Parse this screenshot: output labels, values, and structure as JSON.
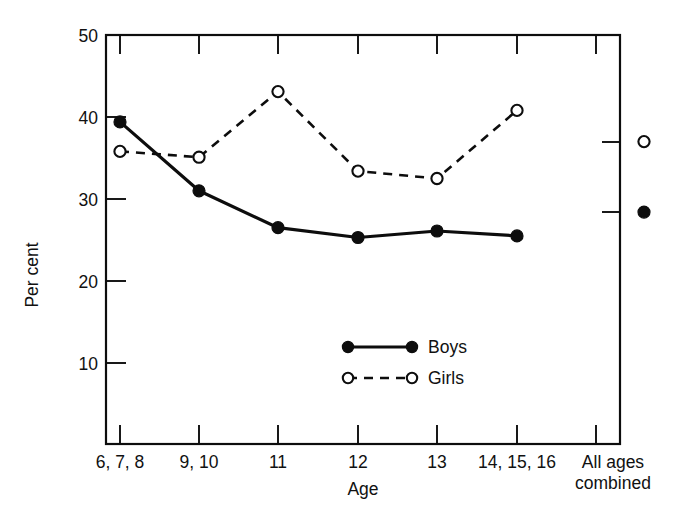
{
  "chart_data": {
    "type": "line",
    "title": "",
    "xlabel": "Age",
    "ylabel": "Per cent",
    "categories": [
      "6, 7, 8",
      "9, 10",
      "11",
      "12",
      "13",
      "14, 15, 16",
      "All ages combined"
    ],
    "ylim": [
      0,
      50
    ],
    "yticks": [
      10,
      20,
      30,
      40,
      50
    ],
    "ytick_labels": [
      "10",
      "20",
      "30",
      "40",
      "50"
    ],
    "grid": false,
    "legend_position": "inside-bottom-center",
    "series": [
      {
        "name": "Boys",
        "marker": "filled-circle",
        "line_style": "solid",
        "values": [
          39.4,
          31.0,
          26.5,
          25.3,
          26.1,
          25.5,
          28.4
        ]
      },
      {
        "name": "Girls",
        "marker": "open-circle",
        "line_style": "dashed",
        "values": [
          35.8,
          35.1,
          43.1,
          33.4,
          32.5,
          40.8,
          37.0
        ]
      }
    ]
  },
  "axes": {
    "y_title": "Per cent",
    "x_title": "Age",
    "x_tick_labels": [
      {
        "line1": "6, 7, 8",
        "line2": ""
      },
      {
        "line1": "9, 10",
        "line2": ""
      },
      {
        "line1": "11",
        "line2": ""
      },
      {
        "line1": "12",
        "line2": ""
      },
      {
        "line1": "13",
        "line2": ""
      },
      {
        "line1": "14, 15, 16",
        "line2": ""
      },
      {
        "line1": "All ages",
        "line2": "combined"
      }
    ],
    "y_tick_labels": [
      "50",
      "40",
      "30",
      "20",
      "10"
    ]
  },
  "legend": {
    "items": [
      {
        "label": "Boys",
        "style": "solid-filled"
      },
      {
        "label": "Girls",
        "style": "dashed-open"
      }
    ]
  },
  "colors": {
    "ink": "#0d0d0d",
    "background": "#ffffff",
    "marker_fill_open": "#ffffff"
  }
}
